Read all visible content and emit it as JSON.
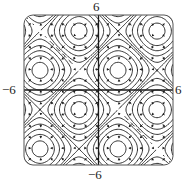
{
  "chart_data": {
    "type": "contour",
    "title": "",
    "function": "sin(x) + sin(y)",
    "xlabel": "",
    "ylabel": "",
    "xlim": [
      -6,
      6
    ],
    "ylim": [
      -6,
      6
    ],
    "tick_labels": {
      "x_min": "−6",
      "x_max": "6",
      "y_min": "−6",
      "y_max": "6"
    },
    "contour_levels": [
      -1.8,
      -1.4,
      -1.0,
      -0.6,
      -0.2,
      0.2,
      0.6,
      1.0,
      1.4,
      1.8
    ],
    "saddle_level": 0,
    "extrema": [
      {
        "x": -4.71,
        "y": 1.57,
        "type": "max"
      },
      {
        "x": 1.57,
        "y": 1.57,
        "type": "max"
      },
      {
        "x": -1.57,
        "y": 4.71,
        "type": "max"
      },
      {
        "x": 4.71,
        "y": 4.71,
        "type": "max"
      },
      {
        "x": -4.71,
        "y": -4.71,
        "type": "max"
      },
      {
        "x": 1.57,
        "y": -4.71,
        "type": "max"
      },
      {
        "x": -1.57,
        "y": -1.57,
        "type": "min"
      },
      {
        "x": 4.71,
        "y": -1.57,
        "type": "min"
      }
    ],
    "vector_field": "gradient (cos x, cos y)",
    "grid": false,
    "axes_through_origin": true,
    "frame": "rounded-square",
    "colors": {
      "lines": "#1a1a1a",
      "background": "#ffffff"
    }
  }
}
